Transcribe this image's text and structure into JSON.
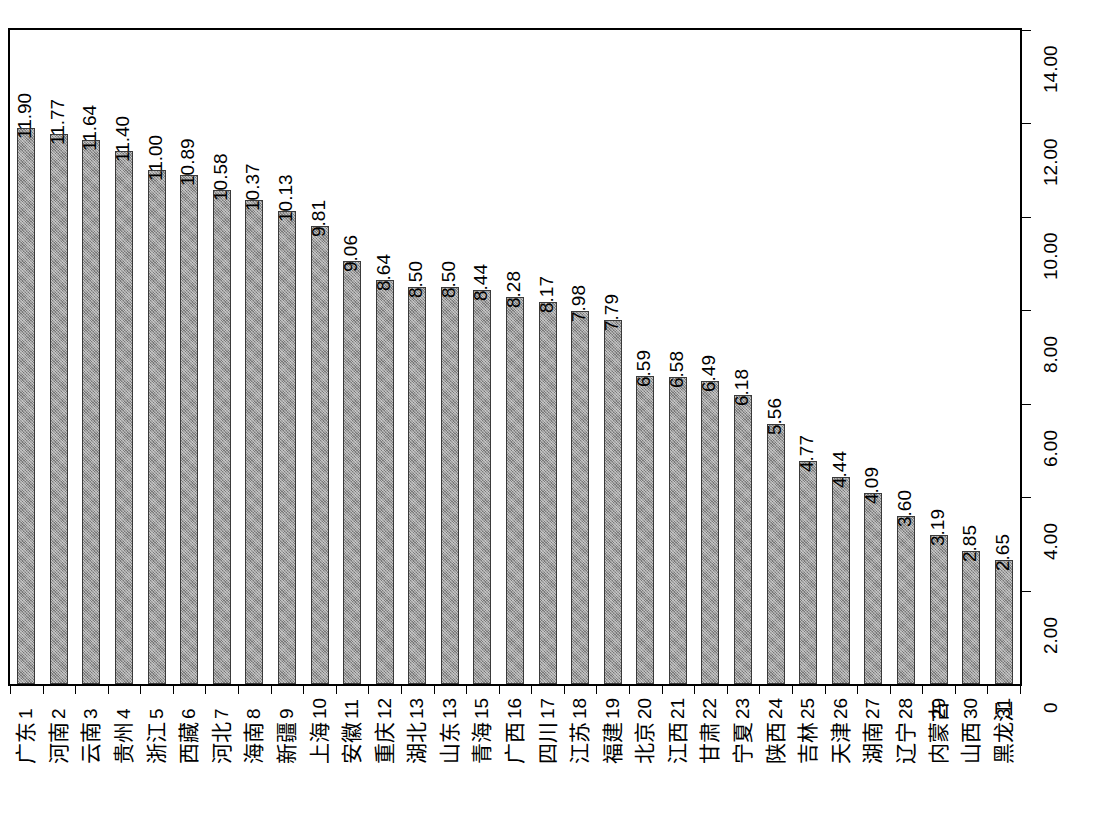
{
  "chart_data": {
    "type": "bar",
    "title": "",
    "subtitle": "",
    "xlabel": "",
    "ylabel": "",
    "ylim": [
      0,
      14
    ],
    "grid": false,
    "legend": "none",
    "orientation": "vertical",
    "axis_position": "right",
    "ytick_labels": [
      "0",
      "2.00",
      "4.00",
      "6.00",
      "8.00",
      "10.00",
      "12.00",
      "14.00"
    ],
    "ytick_values": [
      0,
      2,
      4,
      6,
      8,
      10,
      12,
      14
    ],
    "rank_labels": [
      "1",
      "2",
      "3",
      "4",
      "5",
      "6",
      "7",
      "8",
      "9",
      "10",
      "11",
      "12",
      "13",
      "13",
      "15",
      "16",
      "17",
      "18",
      "19",
      "20",
      "21",
      "22",
      "23",
      "24",
      "25",
      "26",
      "27",
      "28",
      "29",
      "30",
      "31"
    ],
    "categories": [
      "广东",
      "河南",
      "云南",
      "贵州",
      "浙江",
      "西藏",
      "河北",
      "海南",
      "新疆",
      "上海",
      "安徽",
      "重庆",
      "湖北",
      "山东",
      "青海",
      "广西",
      "四川",
      "江苏",
      "福建",
      "北京",
      "江西",
      "甘肃",
      "宁夏",
      "陕西",
      "吉林",
      "天津",
      "湖南",
      "辽宁",
      "内蒙古",
      "山西",
      "黑龙江"
    ],
    "values": [
      11.9,
      11.77,
      11.64,
      11.4,
      11.0,
      10.89,
      10.58,
      10.37,
      10.13,
      9.81,
      9.06,
      8.64,
      8.5,
      8.5,
      8.44,
      8.28,
      8.17,
      7.98,
      7.79,
      6.59,
      6.58,
      6.49,
      6.18,
      5.56,
      4.77,
      4.44,
      4.09,
      3.6,
      3.19,
      2.85,
      2.65
    ],
    "value_labels": [
      "11.90",
      "11.77",
      "11.64",
      "11.40",
      "11.00",
      "10.89",
      "10.58",
      "10.37",
      "10.13",
      "9.81",
      "9.06",
      "8.64",
      "8.50",
      "8.50",
      "8.44",
      "8.28",
      "8.17",
      "7.98",
      "7.79",
      "6.59",
      "6.58",
      "6.49",
      "6.18",
      "5.56",
      "4.77",
      "4.44",
      "4.09",
      "3.60",
      "3.19",
      "2.85",
      "2.65"
    ],
    "bar_fill_color": "#9a9a9a",
    "bar_border_color": "#3a3a3a",
    "axis_color": "#000000",
    "background_color": "#ffffff"
  }
}
